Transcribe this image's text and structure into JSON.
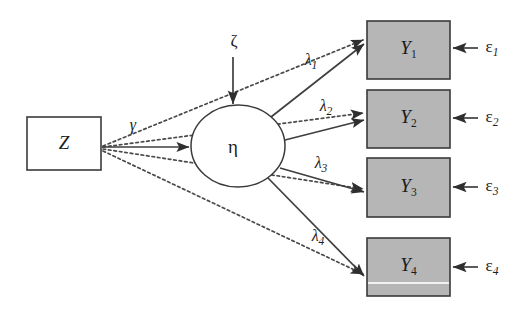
{
  "diagram": {
    "type": "path-diagram",
    "background_color": "#ffffff",
    "stroke_color": "#3f3f3f",
    "observed_fill": "#b6b6b6",
    "latent_fill": "#ffffff"
  },
  "nodes": {
    "exogenous": {
      "label": "Z",
      "shape": "rectangle",
      "fill": "#ffffff",
      "x": 27,
      "y": 117,
      "width": 74,
      "height": 53
    },
    "latent": {
      "label": "η",
      "shape": "ellipse",
      "fill": "#ffffff",
      "cx": 238,
      "cy": 146,
      "rx": 47,
      "ry": 41
    },
    "indicators": [
      {
        "label": "Y",
        "subscript": "1",
        "x": 367,
        "y": 21,
        "width": 83,
        "height": 58
      },
      {
        "label": "Y",
        "subscript": "2",
        "x": 367,
        "y": 90,
        "width": 83,
        "height": 58
      },
      {
        "label": "Y",
        "subscript": "3",
        "x": 367,
        "y": 158,
        "width": 83,
        "height": 59
      },
      {
        "label": "Y",
        "subscript": "4",
        "x": 367,
        "y": 238,
        "width": 83,
        "height": 58
      }
    ]
  },
  "disturbances": {
    "latent_disturbance": {
      "label": "ζ",
      "x": 234,
      "y": 42,
      "arrow_from_y": 57,
      "arrow_to_y": 104
    },
    "errors": [
      {
        "label": "ε",
        "subscript": "1",
        "x": 490,
        "y": 48,
        "arrow_from_x": 478,
        "arrow_to_x": 452
      },
      {
        "label": "ε",
        "subscript": "2",
        "x": 490,
        "y": 118,
        "arrow_from_x": 478,
        "arrow_to_x": 452
      },
      {
        "label": "ε",
        "subscript": "3",
        "x": 490,
        "y": 187,
        "arrow_from_x": 478,
        "arrow_to_x": 452
      },
      {
        "label": "ε",
        "subscript": "4",
        "x": 490,
        "y": 267,
        "arrow_from_x": 478,
        "arrow_to_x": 452
      }
    ]
  },
  "paths": {
    "structural": {
      "label": "γ",
      "label_x": 133,
      "label_y": 126,
      "style": "solid",
      "from": "Z",
      "to": "η"
    },
    "loadings": [
      {
        "label": "λ",
        "subscript": "1",
        "label_x": 311,
        "label_y": 61,
        "style": "solid",
        "from": "η",
        "to": "Y1"
      },
      {
        "label": "λ",
        "subscript": "2",
        "label_x": 326,
        "label_y": 107,
        "style": "solid",
        "from": "η",
        "to": "Y2"
      },
      {
        "label": "λ",
        "subscript": "3",
        "label_x": 321,
        "label_y": 164,
        "style": "solid",
        "from": "η",
        "to": "Y3"
      },
      {
        "label": "λ",
        "subscript": "4",
        "label_x": 318,
        "label_y": 237,
        "style": "solid",
        "from": "η",
        "to": "Y4"
      }
    ],
    "direct_effects": [
      {
        "style": "dotted",
        "from": "Z",
        "to": "Y1"
      },
      {
        "style": "dotted",
        "from": "Z",
        "to": "Y2"
      },
      {
        "style": "dotted",
        "from": "Z",
        "to": "Y3"
      },
      {
        "style": "dotted",
        "from": "Z",
        "to": "Y4"
      }
    ]
  }
}
